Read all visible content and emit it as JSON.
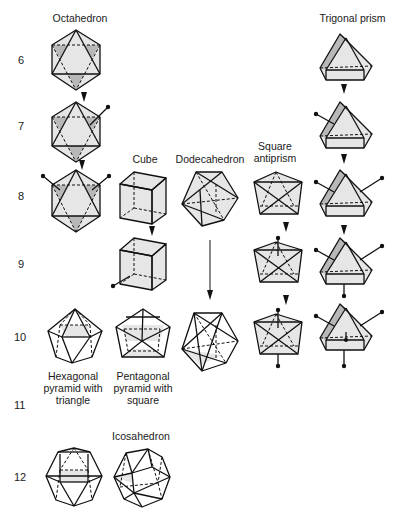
{
  "columns": [
    {
      "id": "octahedron",
      "label": "Octahedron"
    },
    {
      "id": "cube",
      "label": "Cube"
    },
    {
      "id": "dodecahedron",
      "label": "Dodecahedron"
    },
    {
      "id": "square_antiprism",
      "label": "Square\nantiprism"
    },
    {
      "id": "trigonal_prism",
      "label": "Trigonal prism"
    }
  ],
  "row_labels": {
    "r6": "6",
    "r7": "7",
    "r8": "8",
    "r9": "9",
    "r10": "10",
    "r11": "11",
    "r12": "12"
  },
  "shape_labels": {
    "hexagonal_pyramid": "Hexagonal\npyramid with\ntriangle",
    "pentagonal_pyramid": "Pentagonal\npyramid with\nsquare",
    "icosahedron": "Icosahedron"
  },
  "colors": {
    "edge": "#111111",
    "face_light": "#e6e6e6",
    "face_dark": "#b8b8b8"
  }
}
